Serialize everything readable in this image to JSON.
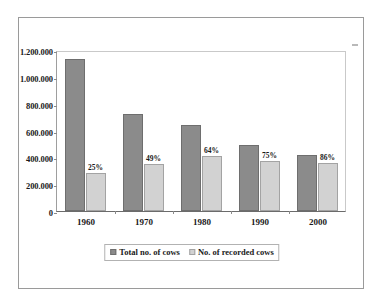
{
  "chart_data": {
    "type": "bar",
    "title": "",
    "subtitle": "",
    "xlabel": "",
    "ylabel": "",
    "categories": [
      "1960",
      "1970",
      "1980",
      "1990",
      "2000"
    ],
    "ylim": [
      0,
      1200000
    ],
    "ytick_labels": [
      "1.200.000",
      "1.000.000",
      "800.000",
      "600.000",
      "400.000",
      "200.000",
      "0"
    ],
    "ytick_values": [
      1200000,
      1000000,
      800000,
      600000,
      400000,
      200000,
      0
    ],
    "grid": false,
    "legend_position": "bottom",
    "series": [
      {
        "name": "Total no. of cows",
        "color": "#8b8b8b",
        "values": [
          1130000,
          720000,
          640000,
          490000,
          415000
        ]
      },
      {
        "name": "No. of recorded cows",
        "color": "#d2d2d2",
        "values": [
          285000,
          350000,
          410000,
          370000,
          355000
        ]
      }
    ],
    "annotations": {
      "label": "percent recorded of total, shown above the light bars",
      "values": [
        "25%",
        "49%",
        "64%",
        "75%",
        "86%"
      ]
    }
  },
  "legend": {
    "entries": [
      {
        "label": "Total no. of cows",
        "swatch": "total"
      },
      {
        "label": "No. of recorded cows",
        "swatch": "recorded"
      }
    ]
  }
}
